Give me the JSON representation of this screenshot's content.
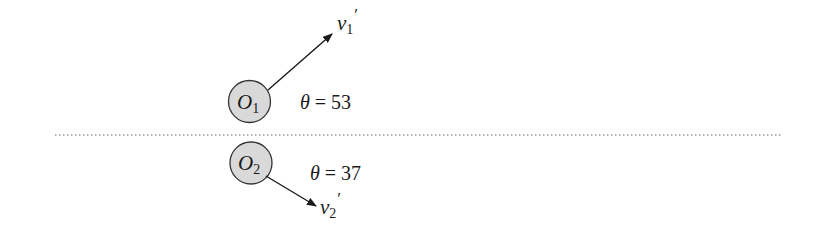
{
  "diagram": {
    "type": "collision-diagram",
    "boundary_line": {
      "style": "dotted",
      "color": "#555555"
    },
    "bodies": [
      {
        "id": "O1",
        "label_base": "O",
        "label_sub": "1",
        "fill": "#d9d9d9",
        "velocity": {
          "label_base": "v",
          "label_sub": "1",
          "label_prime": "′",
          "direction": "up-right"
        },
        "angle": {
          "symbol": "θ",
          "equals": " = ",
          "value": "53"
        }
      },
      {
        "id": "O2",
        "label_base": "O",
        "label_sub": "2",
        "fill": "#d9d9d9",
        "velocity": {
          "label_base": "v",
          "label_sub": "2",
          "label_prime": "′",
          "direction": "down-right"
        },
        "angle": {
          "symbol": "θ",
          "equals": " = ",
          "value": "37"
        }
      }
    ]
  }
}
